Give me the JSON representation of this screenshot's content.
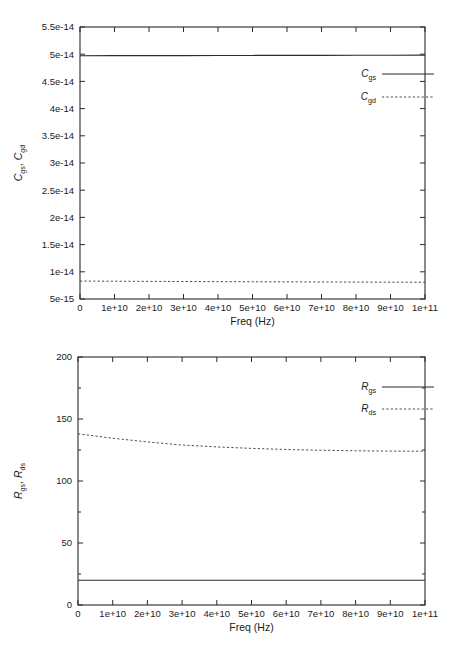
{
  "figure": {
    "panels": [
      {
        "id": "capacitance-panel",
        "ylabel_main": "C",
        "ylabel_sub1": "gs",
        "ylabel_sep": ", ",
        "ylabel_main2": "C",
        "ylabel_sub2": "gd",
        "xlabel": "Freq (Hz)",
        "ytick_labels": [
          "5e-15",
          "1e-14",
          "1.5e-14",
          "2e-14",
          "2.5e-14",
          "3e-14",
          "3.5e-14",
          "4e-14",
          "4.5e-14",
          "5e-14",
          "5.5e-14"
        ],
        "xtick_labels": [
          "0",
          "1e+10",
          "2e+10",
          "3e+10",
          "4e+10",
          "5e+10",
          "6e+10",
          "7e+10",
          "8e+10",
          "9e+10",
          "1e+11"
        ],
        "legend": [
          {
            "main": "C",
            "sub": "gs",
            "style": "solid"
          },
          {
            "main": "C",
            "sub": "gd",
            "style": "dashed"
          }
        ]
      },
      {
        "id": "resistance-panel",
        "ylabel_main": "R",
        "ylabel_sub1": "gs",
        "ylabel_sep": ", ",
        "ylabel_main2": "R",
        "ylabel_sub2": "ds",
        "xlabel": "Freq (Hz)",
        "ytick_labels": [
          "0",
          "50",
          "100",
          "150",
          "200"
        ],
        "xtick_labels": [
          "0",
          "1e+10",
          "2e+10",
          "3e+10",
          "4e+10",
          "5e+10",
          "6e+10",
          "7e+10",
          "8e+10",
          "9e+10",
          "1e+11"
        ],
        "legend": [
          {
            "main": "R",
            "sub": "gs",
            "style": "solid"
          },
          {
            "main": "R",
            "sub": "ds",
            "style": "dashed"
          }
        ]
      }
    ]
  },
  "chart_data": [
    {
      "type": "line",
      "title": "",
      "xlabel": "Freq (Hz)",
      "ylabel": "C_gs, C_gd",
      "xlim": [
        0,
        100000000000.0
      ],
      "ylim": [
        5e-15,
        5.5e-14
      ],
      "xticks": [
        0,
        10000000000.0,
        20000000000.0,
        30000000000.0,
        40000000000.0,
        50000000000.0,
        60000000000.0,
        70000000000.0,
        80000000000.0,
        90000000000.0,
        100000000000.0
      ],
      "yticks": [
        5e-15,
        1e-14,
        1.5e-14,
        2e-14,
        2.5e-14,
        3e-14,
        3.5e-14,
        4e-14,
        4.5e-14,
        5e-14,
        5.5e-14
      ],
      "grid": false,
      "legend_position": "upper right",
      "x": [
        0,
        10000000000.0,
        20000000000.0,
        30000000000.0,
        40000000000.0,
        50000000000.0,
        60000000000.0,
        70000000000.0,
        80000000000.0,
        90000000000.0,
        100000000000.0
      ],
      "series": [
        {
          "name": "C_gs",
          "style": "solid",
          "values": [
            4.972e-14,
            4.973e-14,
            4.974e-14,
            4.975e-14,
            4.976e-14,
            4.977e-14,
            4.978e-14,
            4.979e-14,
            4.98e-14,
            4.981e-14,
            4.982e-14
          ]
        },
        {
          "name": "C_gd",
          "style": "dashed",
          "values": [
            8.3e-15,
            8.27e-15,
            8.24e-15,
            8.21e-15,
            8.19e-15,
            8.17e-15,
            8.15e-15,
            8.13e-15,
            8.11e-15,
            8.1e-15,
            8.08e-15
          ]
        }
      ]
    },
    {
      "type": "line",
      "title": "",
      "xlabel": "Freq (Hz)",
      "ylabel": "R_gs, R_ds",
      "xlim": [
        0,
        100000000000.0
      ],
      "ylim": [
        0,
        200
      ],
      "xticks": [
        0,
        10000000000.0,
        20000000000.0,
        30000000000.0,
        40000000000.0,
        50000000000.0,
        60000000000.0,
        70000000000.0,
        80000000000.0,
        90000000000.0,
        100000000000.0
      ],
      "yticks": [
        0,
        50,
        100,
        150,
        200
      ],
      "yticks_minor": [
        25,
        75,
        125,
        175
      ],
      "grid": false,
      "legend_position": "upper right",
      "x": [
        0,
        10000000000.0,
        20000000000.0,
        30000000000.0,
        40000000000.0,
        50000000000.0,
        60000000000.0,
        70000000000.0,
        80000000000.0,
        90000000000.0,
        100000000000.0
      ],
      "series": [
        {
          "name": "R_gs",
          "style": "solid",
          "values": [
            20,
            20,
            20,
            20,
            20,
            20,
            20,
            20,
            20,
            20,
            20
          ]
        },
        {
          "name": "R_ds",
          "style": "dashed",
          "values": [
            138,
            134.5,
            131.5,
            129,
            127.5,
            126.3,
            125.4,
            124.8,
            124.4,
            124.1,
            124.0
          ]
        }
      ]
    }
  ]
}
